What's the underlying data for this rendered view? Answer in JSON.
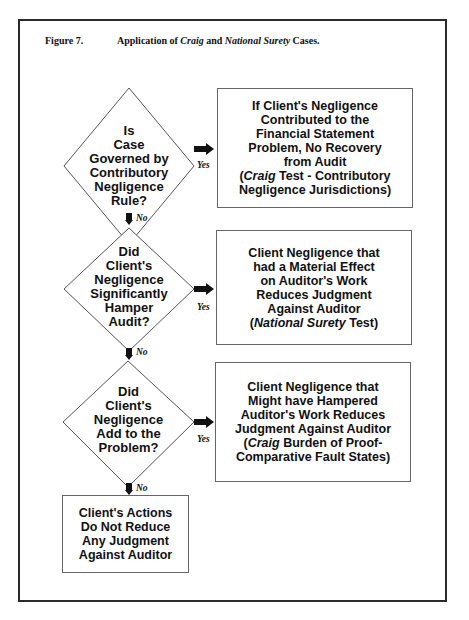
{
  "figure": {
    "number": "Figure 7.",
    "title_parts": [
      {
        "text": "Application of ",
        "italic": false
      },
      {
        "text": "Craig",
        "italic": true
      },
      {
        "text": " and ",
        "italic": false
      },
      {
        "text": "National Surety",
        "italic": true
      },
      {
        "text": " Cases.",
        "italic": false
      }
    ]
  },
  "decisions": [
    {
      "lines": [
        "Is",
        "Case",
        "Governed by",
        "Contributory",
        "Negligence",
        "Rule?"
      ]
    },
    {
      "lines": [
        "Did",
        "Client's",
        "Negligence",
        "Significantly",
        "Hamper",
        "Audit?"
      ]
    },
    {
      "lines": [
        "Did",
        "Client's",
        "Negligence",
        "Add to the",
        "Problem?"
      ]
    }
  ],
  "outcomes": [
    {
      "lines": [
        [
          {
            "t": "If Client's Negligence"
          }
        ],
        [
          {
            "t": "Contributed to the"
          }
        ],
        [
          {
            "t": "Financial Statement"
          }
        ],
        [
          {
            "t": "Problem, No Recovery"
          }
        ],
        [
          {
            "t": "from Audit"
          }
        ],
        [
          {
            "t": "("
          },
          {
            "t": "Craig",
            "i": true
          },
          {
            "t": " Test - Contributory"
          }
        ],
        [
          {
            "t": "Negligence Jurisdictions)"
          }
        ]
      ]
    },
    {
      "lines": [
        [
          {
            "t": "Client Negligence that"
          }
        ],
        [
          {
            "t": "had a Material Effect"
          }
        ],
        [
          {
            "t": "on Auditor's Work"
          }
        ],
        [
          {
            "t": "Reduces Judgment"
          }
        ],
        [
          {
            "t": "Against Auditor"
          }
        ],
        [
          {
            "t": "("
          },
          {
            "t": "National Surety",
            "i": true
          },
          {
            "t": " Test)"
          }
        ]
      ]
    },
    {
      "lines": [
        [
          {
            "t": "Client Negligence that"
          }
        ],
        [
          {
            "t": "Might have Hampered"
          }
        ],
        [
          {
            "t": "Auditor's Work Reduces"
          }
        ],
        [
          {
            "t": "Judgment Against Auditor"
          }
        ],
        [
          {
            "t": "("
          },
          {
            "t": "Craig",
            "i": true
          },
          {
            "t": " Burden of Proof-"
          }
        ],
        [
          {
            "t": "Comparative Fault States)"
          }
        ]
      ]
    },
    {
      "lines": [
        [
          {
            "t": "Client's Actions"
          }
        ],
        [
          {
            "t": "Do Not Reduce"
          }
        ],
        [
          {
            "t": "Any Judgment"
          }
        ],
        [
          {
            "t": "Against Auditor"
          }
        ]
      ]
    }
  ],
  "labels": {
    "yes": "Yes",
    "no": "No"
  },
  "colors": {
    "line": "#555555",
    "border": "#2a2a2a",
    "text": "#111111",
    "arrow": "#111111"
  }
}
